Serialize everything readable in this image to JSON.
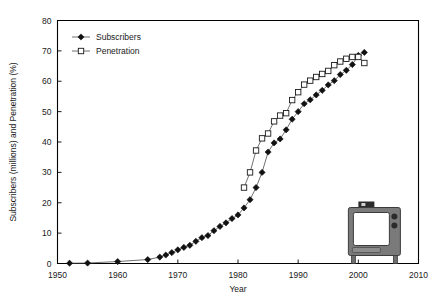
{
  "figure": {
    "name": "cable-tv-subscribers-penetration-chart",
    "background_color": "#ffffff",
    "axis_color": "#000000",
    "subscribers_color": "#111111",
    "penetration_color": "#1a1a1a",
    "line_color": "#4d4d4d"
  },
  "chart_data": {
    "type": "line",
    "title": "",
    "subtitle": "",
    "xlabel": "Year",
    "ylabel": "Subscribers (millions) and Penetration (%)",
    "xlim": [
      1950,
      2010
    ],
    "ylim": [
      0,
      80
    ],
    "xticks": [
      1950,
      1960,
      1970,
      1980,
      1990,
      2000,
      2010
    ],
    "yticks": [
      0,
      10,
      20,
      30,
      40,
      50,
      60,
      70,
      80
    ],
    "xtick_labels": [
      "1950",
      "1960",
      "1970",
      "1980",
      "1990",
      "2000",
      "2010"
    ],
    "ytick_labels": [
      "0",
      "10",
      "20",
      "30",
      "40",
      "50",
      "60",
      "70",
      "80"
    ],
    "grid": false,
    "legend_position": "top-left",
    "legend": [
      "Subscribers",
      "Penetration"
    ],
    "series": [
      {
        "name": "Subscribers",
        "marker": "filled-diamond",
        "unit": "millions",
        "x": [
          1952,
          1955,
          1960,
          1965,
          1967,
          1968,
          1969,
          1970,
          1971,
          1972,
          1973,
          1974,
          1975,
          1976,
          1977,
          1978,
          1979,
          1980,
          1981,
          1982,
          1983,
          1984,
          1985,
          1986,
          1987,
          1988,
          1989,
          1990,
          1991,
          1992,
          1993,
          1994,
          1995,
          1996,
          1997,
          1998,
          1999,
          2000,
          2001
        ],
        "values": [
          0.1,
          0.15,
          0.65,
          1.3,
          2.1,
          2.8,
          3.6,
          4.5,
          5.3,
          6.0,
          7.3,
          8.5,
          9.2,
          10.8,
          12.2,
          13.4,
          14.8,
          16.0,
          18.3,
          21.0,
          25.0,
          30.0,
          36.7,
          39.7,
          41.0,
          44.0,
          47.5,
          50.0,
          52.6,
          53.9,
          55.5,
          57.0,
          58.8,
          60.2,
          62.2,
          63.6,
          65.5,
          68.5,
          69.5
        ]
      },
      {
        "name": "Penetration",
        "marker": "open-square",
        "unit": "%",
        "x": [
          1981,
          1982,
          1983,
          1984,
          1985,
          1986,
          1987,
          1988,
          1989,
          1990,
          1991,
          1992,
          1993,
          1994,
          1995,
          1996,
          1997,
          1998,
          1999,
          2000,
          2001
        ],
        "values": [
          25.0,
          30.0,
          37.2,
          41.2,
          42.8,
          46.8,
          48.7,
          49.5,
          53.8,
          56.4,
          58.9,
          60.2,
          61.4,
          62.4,
          63.4,
          65.3,
          66.5,
          67.4,
          68.0,
          68.0,
          66.0
        ]
      }
    ],
    "annotations": [
      {
        "name": "television-set-icon",
        "label": "television",
        "x": 2003,
        "y": 9
      }
    ]
  },
  "legend_items": [
    {
      "label": "Subscribers",
      "marker": "filled-diamond"
    },
    {
      "label": "Penetration",
      "marker": "open-square"
    }
  ]
}
